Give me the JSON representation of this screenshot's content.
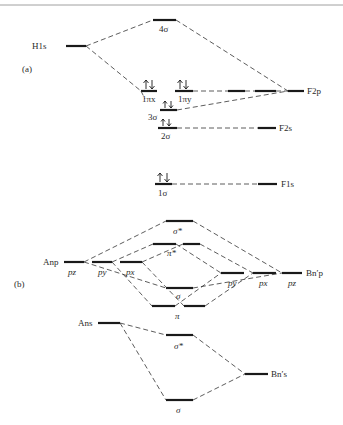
{
  "figure": {
    "part_a": {
      "label": "(a)",
      "atoms": {
        "left": "H1s",
        "right_2p": "F2p",
        "right_2s": "F2s",
        "right_1s": "F1s"
      },
      "orbitals": {
        "o4sigma": "4σ",
        "o1pix": "1πx",
        "o1piy": "1πy",
        "o3sigma": "3σ",
        "o2sigma": "2σ",
        "o1sigma": "1σ"
      },
      "occupied": [
        "1πx",
        "1πy",
        "3σ",
        "2σ",
        "1σ"
      ]
    },
    "part_b": {
      "label": "(b)",
      "atoms": {
        "left_p": "Anp",
        "right_p": "Bn′p",
        "left_s": "Ans",
        "right_s": "Bn′s"
      },
      "left_p_orbitals": [
        "pz",
        "py",
        "px"
      ],
      "right_p_orbitals": [
        "py",
        "px",
        "pz"
      ],
      "orbitals": {
        "sigma_star_p": "σ*",
        "pi_star": "π*",
        "sigma_p": "σ",
        "pi": "π",
        "sigma_star_s": "σ*",
        "sigma_s": "σ"
      }
    }
  }
}
